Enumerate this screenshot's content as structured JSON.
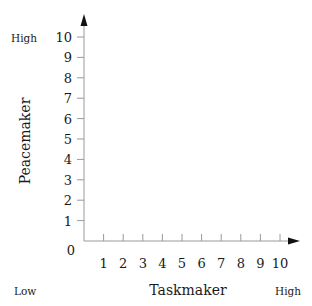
{
  "chart_data": {
    "type": "scatter",
    "title": "",
    "xlabel": "Taskmaker",
    "ylabel": "Peacemaker",
    "xlim": [
      0,
      10
    ],
    "ylim": [
      0,
      10
    ],
    "x_ticks": [
      "1",
      "2",
      "3",
      "4",
      "5",
      "6",
      "7",
      "8",
      "9",
      "10"
    ],
    "y_ticks": [
      "1",
      "2",
      "3",
      "4",
      "5",
      "6",
      "7",
      "8",
      "9",
      "10"
    ],
    "origin_label": "0",
    "grid": false,
    "legend": "none",
    "series": [],
    "annotations": {
      "y_high": "High",
      "x_low": "Low",
      "x_high": "High"
    },
    "colors": {
      "axis": "#9a9a9a",
      "arrow": "#111111",
      "text": "#1a1a1a"
    }
  }
}
